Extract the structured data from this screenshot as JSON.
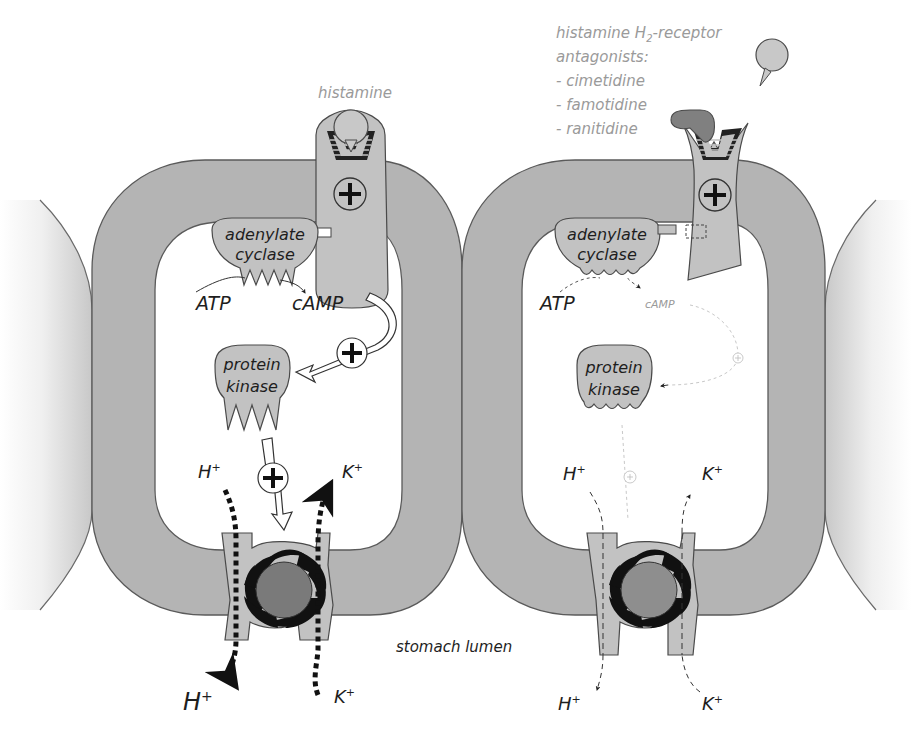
{
  "diagram": {
    "panels": [
      {
        "id": "normal",
        "ligand_label": "histamine",
        "enzyme_label": [
          "adenylate",
          "cyclase"
        ],
        "substrate_label": "ATP",
        "product_label": "cAMP",
        "kinase_label": [
          "protein",
          "kinase"
        ],
        "activation_symbol": "+",
        "ions": {
          "h_in": "H",
          "k_in": "K",
          "h_out": "H",
          "k_out": "K",
          "charge": "+"
        },
        "state": "active"
      },
      {
        "id": "blocked",
        "antagonist_heading": [
          "histamine H",
          "2",
          "-receptor",
          "antagonists:"
        ],
        "antagonist_list": [
          "- cimetidine",
          "- famotidine",
          "- ranitidine"
        ],
        "enzyme_label": [
          "adenylate",
          "cyclase"
        ],
        "substrate_label": "ATP",
        "product_label": "cAMP",
        "kinase_label": [
          "protein",
          "kinase"
        ],
        "activation_symbol": "+",
        "ions": {
          "h_in": "H",
          "k_in": "K",
          "h_out": "H",
          "k_out": "K",
          "charge": "+"
        },
        "state": "inhibited"
      }
    ],
    "lumen_label": "stomach lumen"
  }
}
